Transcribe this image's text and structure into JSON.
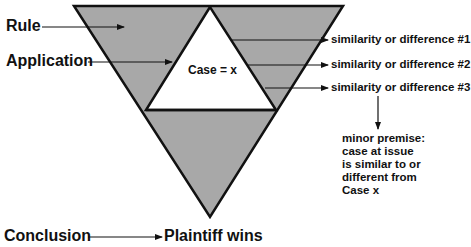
{
  "diagram": {
    "colors": {
      "fill": "#a8a8a8",
      "stroke": "#111111",
      "inner": "#ffffff"
    },
    "left_labels": {
      "rule": "Rule",
      "application": "Application",
      "conclusion": "Conclusion"
    },
    "inner_label": "Case = x",
    "right_labels": [
      "similarity or difference #1",
      "similarity or difference #2",
      "similarity or difference #3"
    ],
    "note_lines": [
      "minor premise:",
      "case at issue",
      "is similar to or",
      "different from",
      "Case x"
    ],
    "outcome": "Plaintiff wins"
  }
}
